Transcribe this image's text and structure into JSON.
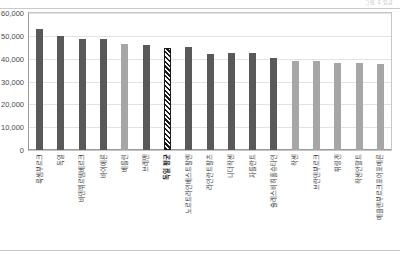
{
  "page": {
    "header_note": "그림 1  임금",
    "background": "#ffffff"
  },
  "chart_data": {
    "type": "bar",
    "title": "",
    "subtitle": "",
    "xlabel": "",
    "ylabel": "",
    "ylim": [
      0,
      60000
    ],
    "grid": true,
    "legend": "none",
    "y_ticks": [
      "60,000",
      "50,000",
      "40,000",
      "30,000",
      "20,000",
      "10,000",
      "0"
    ],
    "y_tick_values": [
      60000,
      50000,
      40000,
      30000,
      20000,
      10000,
      0
    ],
    "categories": [
      "룩셈부르크",
      "독일",
      "바덴뷔르템베르크",
      "바이에른",
      "베를린",
      "브레멘",
      "독일 평균",
      "노르트라인베스트팔렌",
      "라인란트팔츠",
      "니더작센",
      "자를란트",
      "슐레스비히홀슈타인",
      "작센",
      "브란덴부르크",
      "튀링겐",
      "작센안할트",
      "메클렌부르크포어포메른"
    ],
    "values": [
      53000,
      50000,
      48800,
      48700,
      46400,
      46100,
      44800,
      45000,
      42200,
      42300,
      42400,
      40200,
      39100,
      39200,
      37900,
      37900,
      37600
    ],
    "bar_styles": [
      "dark",
      "dark",
      "dark",
      "dark",
      "light",
      "dark",
      "hatched",
      "dark",
      "dark",
      "dark",
      "dark",
      "dark",
      "light",
      "light",
      "light",
      "light",
      "light"
    ],
    "colors": {
      "dark": "#595959",
      "light": "#a6a6a6",
      "hatched": "#1a1a1a",
      "gridline": "#e2e2e2",
      "axis": "#9a9a9a",
      "frame": "#c6c6c6",
      "tick_text": "#4a4a4a",
      "label_text": "#3a3a3a"
    },
    "highlight_index": 6,
    "highlight_label": "독일 평균"
  }
}
